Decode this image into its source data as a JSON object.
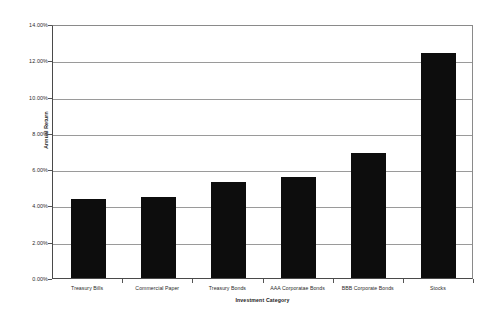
{
  "chart_data": {
    "type": "bar",
    "title": "",
    "xlabel": "Investment Category",
    "ylabel": "Annual Return",
    "categories": [
      "Treasury Bills",
      "Commercial Paper",
      "Treasury Bonds",
      "AAA Corporatae Bonds",
      "BBB Corporate Bonds",
      "Stocks"
    ],
    "values": [
      4.35,
      4.45,
      5.3,
      5.55,
      6.9,
      12.4
    ],
    "value_unit": "%",
    "ylim": [
      0,
      14
    ],
    "ytick_step": 2,
    "ytick_labels": [
      "0.00%",
      "2.00%",
      "4.00%",
      "6.00%",
      "8.00%",
      "10.00%",
      "12.00%",
      "14.00%"
    ],
    "ytick_values": [
      0,
      2,
      4,
      6,
      8,
      10,
      12,
      14
    ],
    "grid": true,
    "grid_axis": "y",
    "legend": false,
    "legend_position": "none",
    "bar_color": "#0d0d0d",
    "gridline_color": "#9a9a9a",
    "axis_color": "#4a4a4a",
    "background_color": "#ffffff",
    "plot_border": true
  }
}
